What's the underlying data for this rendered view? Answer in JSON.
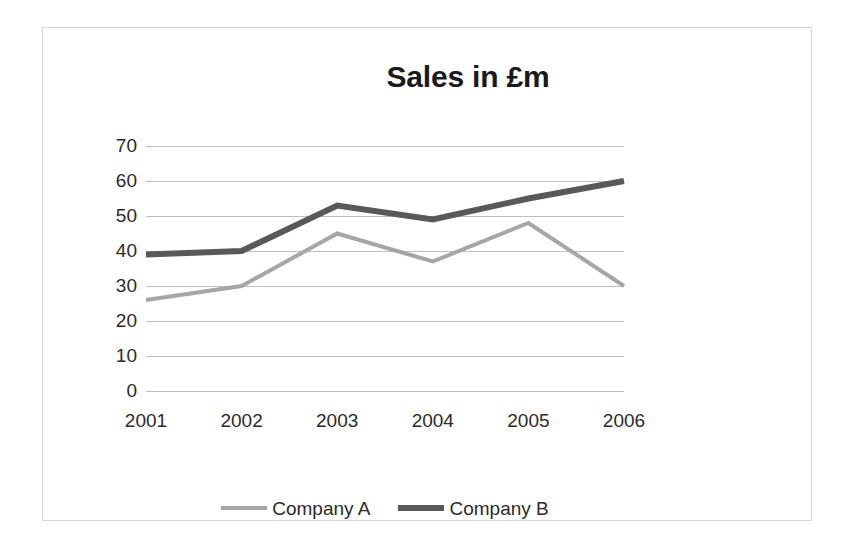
{
  "chart_data": {
    "type": "line",
    "title": "Sales in £m",
    "xlabel": "",
    "ylabel": "",
    "categories": [
      "2001",
      "2002",
      "2003",
      "2004",
      "2005",
      "2006"
    ],
    "series": [
      {
        "name": "Company A",
        "color": "#a6a6a6",
        "line_width": 4,
        "values": [
          26,
          30,
          45,
          37,
          48,
          30
        ]
      },
      {
        "name": "Company B",
        "color": "#595959",
        "line_width": 6,
        "values": [
          39,
          40,
          53,
          49,
          55,
          60
        ]
      }
    ],
    "ylim": [
      0,
      70
    ],
    "y_ticks": [
      70,
      60,
      50,
      40,
      30,
      20,
      10,
      0
    ],
    "y_tick_labels": [
      "70",
      "60",
      "50",
      "40",
      "30",
      "20",
      "10",
      "0"
    ],
    "x_tick_labels": [
      "2001",
      "2002",
      "2003",
      "2004",
      "2005",
      "2006"
    ],
    "grid": true,
    "grid_color": "#bfbfbf",
    "legend_position": "bottom",
    "legend_entries": [
      "Company A",
      "Company B"
    ],
    "background_color": "#ffffff",
    "title_color": "#1a1a1a",
    "tick_label_color": "#2b2b2b",
    "frame_color": "#d8d8d8"
  }
}
